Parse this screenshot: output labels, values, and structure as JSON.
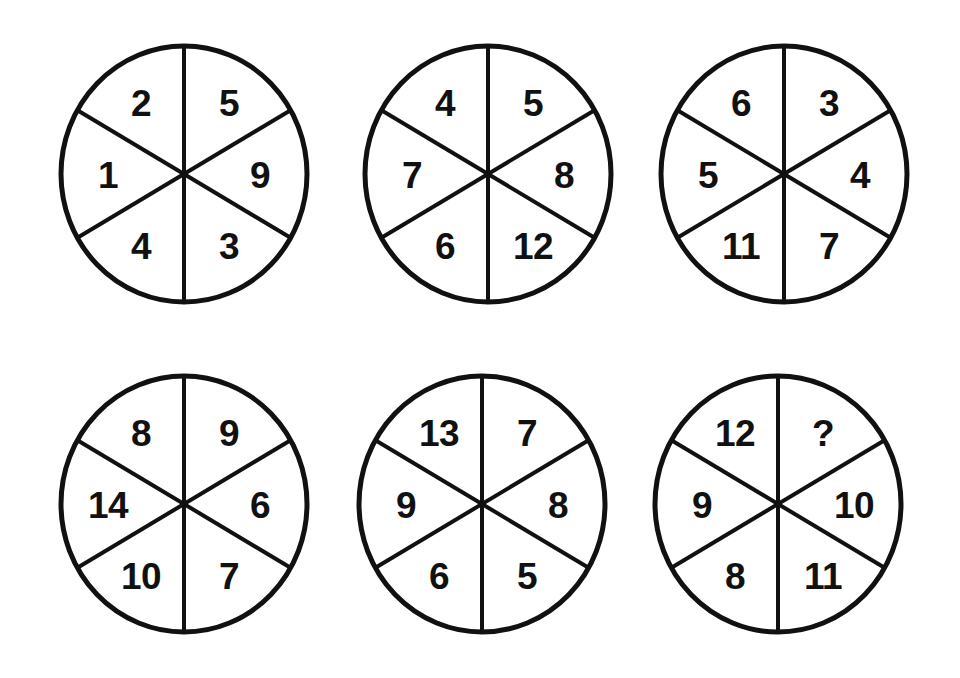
{
  "page": {
    "background_color": "#ffffff",
    "ink_color": "#111111",
    "unknown_marker": "?"
  },
  "layout": {
    "rows": 2,
    "columns": 3,
    "sectors_per_wheel": 6,
    "sector_order": [
      "top-left",
      "top-right",
      "right",
      "bottom-right",
      "bottom-left",
      "left"
    ]
  },
  "wheels": [
    {
      "index": 1,
      "name": "wheel-1",
      "sectors": {
        "top_left": "2",
        "top_right": "5",
        "right": "9",
        "bottom_right": "3",
        "bottom_left": "4",
        "left": "1"
      }
    },
    {
      "index": 2,
      "name": "wheel-2",
      "sectors": {
        "top_left": "4",
        "top_right": "5",
        "right": "8",
        "bottom_right": "12",
        "bottom_left": "6",
        "left": "7"
      }
    },
    {
      "index": 3,
      "name": "wheel-3",
      "sectors": {
        "top_left": "6",
        "top_right": "3",
        "right": "4",
        "bottom_right": "7",
        "bottom_left": "11",
        "left": "5"
      }
    },
    {
      "index": 4,
      "name": "wheel-4",
      "sectors": {
        "top_left": "8",
        "top_right": "9",
        "right": "6",
        "bottom_right": "7",
        "bottom_left": "10",
        "left": "14"
      }
    },
    {
      "index": 5,
      "name": "wheel-5",
      "sectors": {
        "top_left": "13",
        "top_right": "7",
        "right": "8",
        "bottom_right": "5",
        "bottom_left": "6",
        "left": "9"
      }
    },
    {
      "index": 6,
      "name": "wheel-6",
      "sectors": {
        "top_left": "12",
        "top_right": "?",
        "right": "10",
        "bottom_right": "11",
        "bottom_left": "8",
        "left": "9"
      }
    }
  ]
}
